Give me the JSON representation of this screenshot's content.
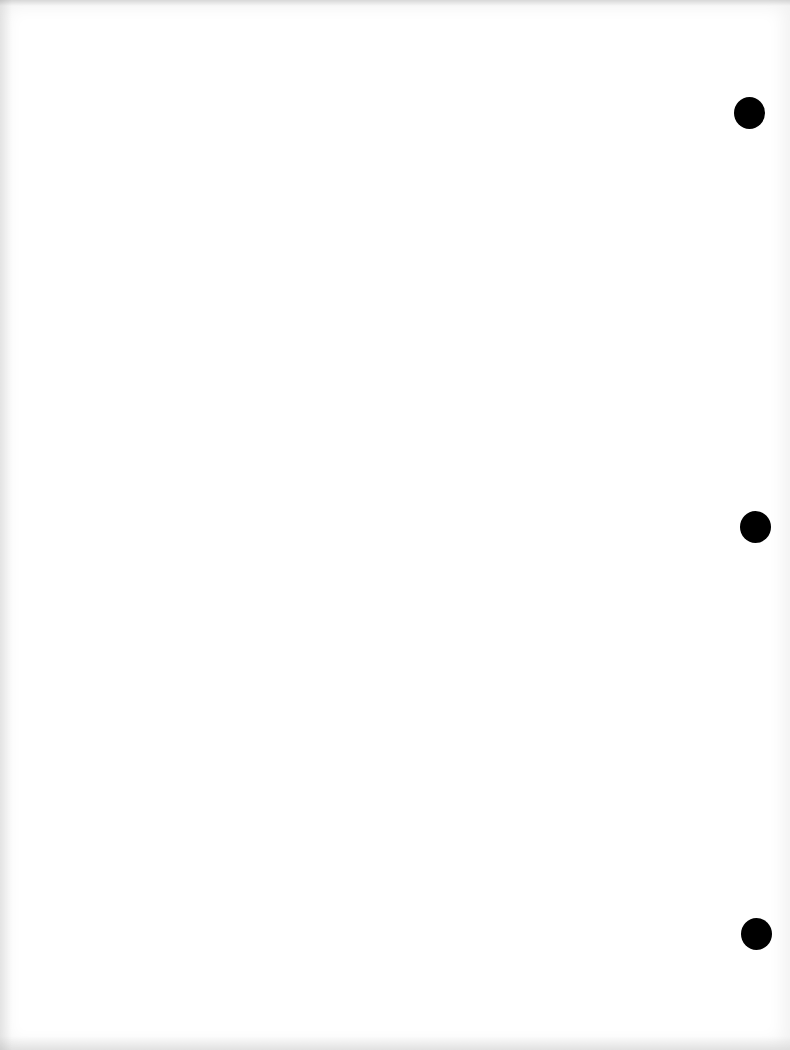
{
  "document": {
    "type": "blank scanned page",
    "text_content": "",
    "punch_holes": [
      {
        "position": "top",
        "x": 750,
        "y": 113
      },
      {
        "position": "middle",
        "x": 755,
        "y": 527
      },
      {
        "position": "bottom",
        "x": 756,
        "y": 934
      }
    ],
    "colors": {
      "paper": "#ffffff",
      "hole": "#000000"
    }
  }
}
